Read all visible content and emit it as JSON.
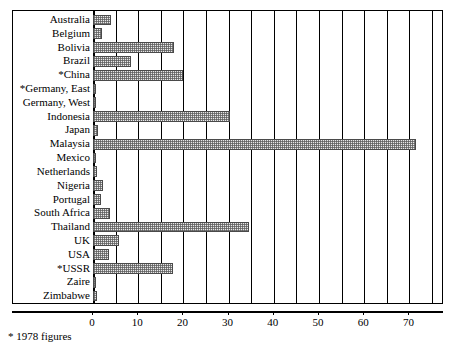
{
  "chart_data": {
    "type": "bar",
    "orientation": "horizontal",
    "title": "",
    "subtitle": "",
    "xlabel": "",
    "ylabel": "",
    "xlim": [
      0,
      75
    ],
    "grid": true,
    "legend": null,
    "gridline_interval": 5,
    "tick_interval": 10,
    "tick_labels": [
      "0",
      "10",
      "20",
      "30",
      "40",
      "50",
      "60",
      "70"
    ],
    "tick_values": [
      0,
      10,
      20,
      30,
      40,
      50,
      60,
      70
    ],
    "gridline_values": [
      0,
      5,
      10,
      15,
      20,
      25,
      30,
      35,
      40,
      45,
      50,
      55,
      60,
      65,
      70,
      75
    ],
    "categories": [
      "Australia",
      "Belgium",
      "Bolivia",
      "Brazil",
      "*China",
      "*Germany, East",
      "Germany, West",
      "Indonesia",
      "Japan",
      "Malaysia",
      "Mexico",
      "Netherlands",
      "Nigeria",
      "Portugal",
      "South Africa",
      "Thailand",
      "UK",
      "USA",
      "*USSR",
      "Zaire",
      "Zimbabwe"
    ],
    "values": [
      3.9,
      2.0,
      18.0,
      8.3,
      19.9,
      0.3,
      0.5,
      30.2,
      1.1,
      71.5,
      0.2,
      0.8,
      2.2,
      1.8,
      3.7,
      34.5,
      5.7,
      3.6,
      17.8,
      0.4,
      0.9
    ],
    "annotations": [
      "* 1978 figures"
    ]
  },
  "footnote": "* 1978 figures",
  "style": {
    "bar_fill": "#e8e8e8",
    "bar_edge": "#4a4a4a",
    "axis_color": "#000000",
    "background": "#ffffff"
  }
}
